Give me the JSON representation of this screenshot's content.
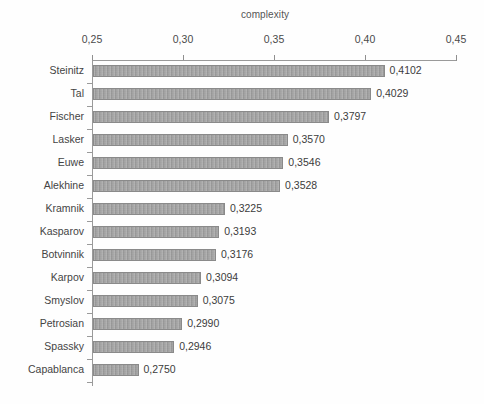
{
  "chart_data": {
    "type": "bar",
    "orientation": "horizontal",
    "title": "complexity",
    "xlabel": "",
    "ylabel": "",
    "xlim": [
      0.25,
      0.45
    ],
    "xticks": [
      "0,25",
      "0,30",
      "0,35",
      "0,40",
      "0,45"
    ],
    "xtick_values": [
      0.25,
      0.3,
      0.35,
      0.4,
      0.45
    ],
    "grid": false,
    "legend": false,
    "axis_position": "top",
    "bar_color": "#9e9e9e",
    "categories": [
      "Steinitz",
      "Tal",
      "Fischer",
      "Lasker",
      "Euwe",
      "Alekhine",
      "Kramnik",
      "Kasparov",
      "Botvinnik",
      "Karpov",
      "Smyslov",
      "Petrosian",
      "Spassky",
      "Capablanca"
    ],
    "values": [
      0.4102,
      0.4029,
      0.3797,
      0.357,
      0.3546,
      0.3528,
      0.3225,
      0.3193,
      0.3176,
      0.3094,
      0.3075,
      0.299,
      0.2946,
      0.275
    ],
    "value_labels": [
      "0,4102",
      "0,4029",
      "0,3797",
      "0,3570",
      "0,3546",
      "0,3528",
      "0,3225",
      "0,3193",
      "0,3176",
      "0,3094",
      "0,3075",
      "0,2990",
      "0,2946",
      "0,2750"
    ]
  }
}
